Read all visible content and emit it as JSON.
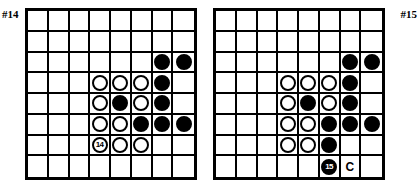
{
  "page": {
    "background_color": "#ffffff",
    "ink_color": "#000000",
    "width": 419,
    "height": 191
  },
  "diagrams": [
    {
      "id": "diagram-14",
      "caption": "#14",
      "caption_position": "top-left",
      "board": {
        "columns": 8,
        "rows": 8,
        "line_color": "#000000",
        "background_color": "#ffffff"
      },
      "stones": [
        {
          "row": 3,
          "col": 7,
          "color": "black",
          "label": ""
        },
        {
          "row": 3,
          "col": 8,
          "color": "black",
          "label": ""
        },
        {
          "row": 4,
          "col": 4,
          "color": "white",
          "label": ""
        },
        {
          "row": 4,
          "col": 5,
          "color": "white",
          "label": ""
        },
        {
          "row": 4,
          "col": 6,
          "color": "white",
          "label": ""
        },
        {
          "row": 4,
          "col": 7,
          "color": "black",
          "label": ""
        },
        {
          "row": 5,
          "col": 4,
          "color": "white",
          "label": ""
        },
        {
          "row": 5,
          "col": 5,
          "color": "black",
          "label": ""
        },
        {
          "row": 5,
          "col": 6,
          "color": "white",
          "label": ""
        },
        {
          "row": 5,
          "col": 7,
          "color": "black",
          "label": ""
        },
        {
          "row": 6,
          "col": 4,
          "color": "white",
          "label": ""
        },
        {
          "row": 6,
          "col": 5,
          "color": "white",
          "label": ""
        },
        {
          "row": 6,
          "col": 6,
          "color": "black",
          "label": ""
        },
        {
          "row": 6,
          "col": 7,
          "color": "black",
          "label": ""
        },
        {
          "row": 6,
          "col": 8,
          "color": "black",
          "label": ""
        },
        {
          "row": 7,
          "col": 4,
          "color": "white",
          "label": "14"
        },
        {
          "row": 7,
          "col": 5,
          "color": "white",
          "label": ""
        },
        {
          "row": 7,
          "col": 6,
          "color": "white",
          "label": ""
        }
      ],
      "markers": []
    },
    {
      "id": "diagram-15",
      "caption": "#15",
      "caption_position": "top-right",
      "board": {
        "columns": 8,
        "rows": 8,
        "line_color": "#000000",
        "background_color": "#ffffff"
      },
      "stones": [
        {
          "row": 3,
          "col": 7,
          "color": "black",
          "label": ""
        },
        {
          "row": 3,
          "col": 8,
          "color": "black",
          "label": ""
        },
        {
          "row": 4,
          "col": 4,
          "color": "white",
          "label": ""
        },
        {
          "row": 4,
          "col": 5,
          "color": "white",
          "label": ""
        },
        {
          "row": 4,
          "col": 6,
          "color": "white",
          "label": ""
        },
        {
          "row": 4,
          "col": 7,
          "color": "black",
          "label": ""
        },
        {
          "row": 5,
          "col": 4,
          "color": "white",
          "label": ""
        },
        {
          "row": 5,
          "col": 5,
          "color": "black",
          "label": ""
        },
        {
          "row": 5,
          "col": 6,
          "color": "white",
          "label": ""
        },
        {
          "row": 5,
          "col": 7,
          "color": "black",
          "label": ""
        },
        {
          "row": 6,
          "col": 4,
          "color": "white",
          "label": ""
        },
        {
          "row": 6,
          "col": 5,
          "color": "white",
          "label": ""
        },
        {
          "row": 6,
          "col": 6,
          "color": "black",
          "label": ""
        },
        {
          "row": 6,
          "col": 7,
          "color": "black",
          "label": ""
        },
        {
          "row": 6,
          "col": 8,
          "color": "black",
          "label": ""
        },
        {
          "row": 7,
          "col": 4,
          "color": "white",
          "label": ""
        },
        {
          "row": 7,
          "col": 5,
          "color": "white",
          "label": ""
        },
        {
          "row": 7,
          "col": 6,
          "color": "black",
          "label": ""
        },
        {
          "row": 8,
          "col": 6,
          "color": "black",
          "label": "15"
        }
      ],
      "markers": [
        {
          "row": 8,
          "col": 7,
          "text": "C"
        }
      ]
    }
  ]
}
